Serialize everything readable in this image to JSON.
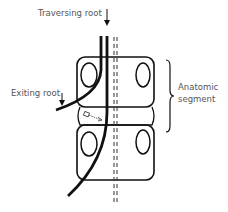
{
  "diagram": {
    "labels": {
      "traversing_root": "Traversing root",
      "exiting_root": "Exiting root",
      "anatomic_segment_line1": "Anatomic",
      "anatomic_segment_line2": "segment"
    },
    "colors": {
      "stroke": "#111111",
      "text": "#555555",
      "background": "#ffffff"
    }
  }
}
